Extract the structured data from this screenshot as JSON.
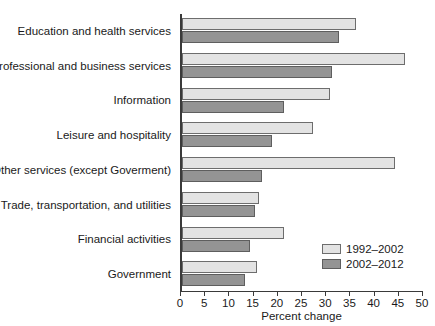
{
  "chart_data": {
    "type": "bar",
    "orientation": "horizontal",
    "title": "",
    "xlabel": "Percent change",
    "ylabel": "",
    "xlim": [
      0,
      50
    ],
    "xticks": [
      0,
      5,
      10,
      15,
      20,
      25,
      30,
      35,
      40,
      45,
      50
    ],
    "grid": false,
    "legend_position": "bottom-right",
    "categories": [
      "Education and health services",
      "Professional and business services",
      "Information",
      "Leisure and hospitality",
      "Other services (except Goverment)",
      "Trade, transportation, and utilities",
      "Financial activities",
      "Government"
    ],
    "series": [
      {
        "name": "1992–2002",
        "color": "#e3e3e3",
        "values": [
          36.0,
          46.0,
          30.5,
          27.0,
          44.0,
          16.0,
          21.0,
          15.5
        ]
      },
      {
        "name": "2002–2012",
        "color": "#949494",
        "values": [
          32.5,
          31.0,
          21.0,
          18.5,
          16.5,
          15.0,
          14.0,
          13.0
        ]
      }
    ]
  },
  "legend": {
    "items": [
      {
        "label": "1992–2002",
        "swatch": "light"
      },
      {
        "label": "2002–2012",
        "swatch": "dark"
      }
    ]
  }
}
